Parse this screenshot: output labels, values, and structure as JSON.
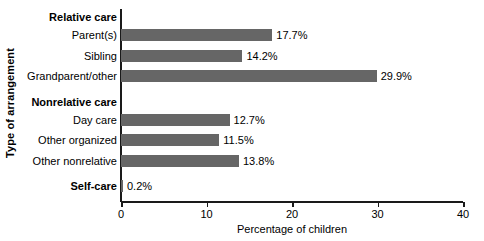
{
  "chart_data": {
    "type": "bar",
    "orientation": "horizontal",
    "title": "",
    "xlabel": "Percentage of children",
    "ylabel": "Type of arrangement",
    "xlim": [
      0,
      40
    ],
    "xticks": [
      0,
      10,
      20,
      30,
      40
    ],
    "xtick_labels": [
      "0",
      "10",
      "20",
      "30",
      "40"
    ],
    "grid": false,
    "legend": null,
    "bar_color": "#666666",
    "categories": [
      "Parent(s)",
      "Sibling",
      "Grandparent/other",
      "Day care",
      "Other organized",
      "Other nonrelative",
      "Self-care"
    ],
    "values": [
      17.7,
      14.2,
      29.9,
      12.7,
      11.5,
      13.8,
      0.2
    ],
    "value_labels": [
      "17.7%",
      "14.2%",
      "29.9%",
      "12.7%",
      "11.5%",
      "13.8%",
      "0.2%"
    ],
    "group_headers": [
      "Relative care",
      "Nonrelative care"
    ],
    "rows": [
      {
        "kind": "group",
        "label": "Relative care",
        "y": 11
      },
      {
        "kind": "bar",
        "label": "Parent(s)",
        "value": 17.7,
        "value_label": "17.7%",
        "y": 29
      },
      {
        "kind": "bar",
        "label": "Sibling",
        "value": 14.2,
        "value_label": "14.2%",
        "y": 50
      },
      {
        "kind": "bar",
        "label": "Grandparent/other",
        "value": 29.9,
        "value_label": "29.9%",
        "y": 70
      },
      {
        "kind": "group",
        "label": "Nonrelative care",
        "y": 96
      },
      {
        "kind": "bar",
        "label": "Day care",
        "value": 12.7,
        "value_label": "12.7%",
        "y": 114
      },
      {
        "kind": "bar",
        "label": "Other organized",
        "value": 11.5,
        "value_label": "11.5%",
        "y": 134
      },
      {
        "kind": "bar",
        "label": "Other nonrelative",
        "value": 13.8,
        "value_label": "13.8%",
        "y": 155
      },
      {
        "kind": "bar",
        "label": "Self-care",
        "value": 0.2,
        "value_label": "0.2%",
        "y": 180,
        "bold": true
      }
    ]
  }
}
